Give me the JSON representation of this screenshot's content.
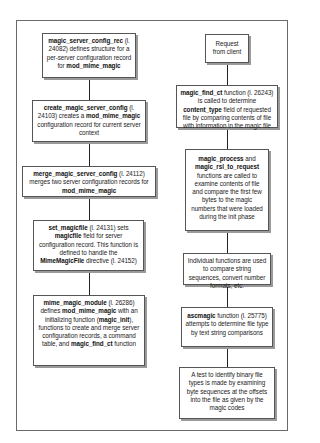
{
  "diagram": {
    "left_column": [
      {
        "id": "magic_server_config_rec",
        "parts": [
          {
            "b": "magic_server_config_rec"
          },
          {
            "t": " (l. 24082) defines structure for a per-server configuration record for "
          },
          {
            "b": "mod_mime_magic"
          }
        ]
      },
      {
        "id": "create_magic_server_config",
        "parts": [
          {
            "b": "create_magic_server_config"
          },
          {
            "t": " (l. 24103) creates a "
          },
          {
            "b": "mod_mime_magic"
          },
          {
            "t": " configuration record for current server context"
          }
        ]
      },
      {
        "id": "merge_magic_server_config",
        "parts": [
          {
            "b": "merge_magic_server_config"
          },
          {
            "t": " (l. 24112) merges two server configuration records for "
          },
          {
            "b": "mod_mime_magic"
          }
        ]
      },
      {
        "id": "set_magicfile",
        "parts": [
          {
            "b": "set_magicfile"
          },
          {
            "t": " (l. 24131) sets "
          },
          {
            "b": "magicfile"
          },
          {
            "t": " field for server configuration record. This function is defined to handle the "
          },
          {
            "b": "MimeMagicFile"
          },
          {
            "t": " directive (l. 24152)"
          }
        ]
      },
      {
        "id": "mime_magic_module",
        "parts": [
          {
            "b": "mime_magic_module"
          },
          {
            "t": " (l. 26286) defines "
          },
          {
            "b": "mod_mime_magic"
          },
          {
            "t": " with an initializing function ("
          },
          {
            "b": "magic_init"
          },
          {
            "t": "), functions to create and merge server configuration records, a command table, and "
          },
          {
            "b": "magic_find_ct"
          },
          {
            "t": " function"
          }
        ]
      }
    ],
    "right_column": [
      {
        "id": "request_from_client",
        "parts": [
          {
            "t": "Request from client"
          }
        ]
      },
      {
        "id": "magic_find_ct",
        "parts": [
          {
            "b": "magic_find_ct"
          },
          {
            "t": " function (l. 26243) is called to determine "
          },
          {
            "b": "content_type"
          },
          {
            "t": " field of requested file by comparing contents of file with information in the magic file"
          }
        ]
      },
      {
        "id": "magic_process",
        "parts": [
          {
            "b": "magic_process"
          },
          {
            "t": " and "
          },
          {
            "b": "magic_rsl_to_request"
          },
          {
            "t": " functions are called to examine contents of file and compare the first few bytes to the magic numbers that were loaded during the init phase"
          }
        ]
      },
      {
        "id": "individual_functions",
        "parts": [
          {
            "t": "Individual functions are used to compare string sequences, convert number formats, etc."
          }
        ]
      },
      {
        "id": "ascmagic",
        "parts": [
          {
            "b": "ascmagic"
          },
          {
            "t": " function (l. 25775) attempts to determine file type by text string comparisons"
          }
        ]
      },
      {
        "id": "binary_test",
        "parts": [
          {
            "t": "A test to identify binary file types is made by examining byte sequences at the offsets into the file as given by the magic codes"
          }
        ]
      }
    ],
    "colors": {
      "border": "#555555",
      "shadow": "#9a9a9a",
      "connector": "#222222",
      "frame": "#6a6a6a"
    }
  }
}
